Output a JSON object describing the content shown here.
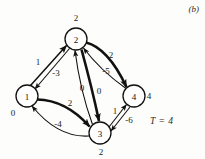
{
  "figure": {
    "panel_label": "(b)",
    "t_label": "T = 4"
  },
  "graph_data": {
    "type": "diagram",
    "nodes": [
      {
        "id": "1",
        "label": "1",
        "dist": "0",
        "cx": 27,
        "cy": 96,
        "r": 11,
        "dist_x": 13,
        "dist_y": 113
      },
      {
        "id": "2",
        "label": "2",
        "dist": "2",
        "cx": 76,
        "cy": 39,
        "r": 11,
        "dist_x": 76,
        "dist_y": 18
      },
      {
        "id": "3",
        "label": "3",
        "dist": "2",
        "cx": 100,
        "cy": 133,
        "r": 11,
        "dist_x": 101,
        "dist_y": 152
      },
      {
        "id": "4",
        "label": "4",
        "dist": "4",
        "cx": 134,
        "cy": 96,
        "r": 11,
        "dist_x": 149,
        "dist_y": 96
      }
    ],
    "edges": [
      {
        "from": "1",
        "to": "2",
        "weight": "1",
        "lx": 38,
        "ly": 62,
        "thick": false,
        "highlight": true
      },
      {
        "from": "2",
        "to": "1",
        "weight": "-3",
        "lx": 56,
        "ly": 73,
        "thick": false,
        "highlight": false
      },
      {
        "from": "2",
        "to": "4",
        "weight": "2",
        "lx": 111,
        "ly": 55,
        "thick": true,
        "highlight": true
      },
      {
        "from": "4",
        "to": "2",
        "weight": "-5",
        "lx": 106,
        "ly": 71,
        "thick": false,
        "highlight": false
      },
      {
        "from": "3",
        "to": "2",
        "weight": "0",
        "lx": 82,
        "ly": 88,
        "thick": false,
        "highlight": false
      },
      {
        "from": "2",
        "to": "3",
        "weight": "0",
        "lx": 99,
        "ly": 91,
        "thick": true,
        "highlight": true
      },
      {
        "from": "1",
        "to": "3",
        "weight": "2",
        "lx": 70,
        "ly": 103,
        "thick": true,
        "highlight": true
      },
      {
        "from": "3",
        "to": "1",
        "weight": "-4",
        "lx": 58,
        "ly": 124,
        "thick": false,
        "highlight": false
      },
      {
        "from": "3",
        "to": "4",
        "weight": "1",
        "lx": 115,
        "ly": 111,
        "thick": false,
        "highlight": false
      },
      {
        "from": "4",
        "to": "3",
        "weight": "-6",
        "lx": 129,
        "ly": 120,
        "thick": false,
        "highlight": false
      }
    ]
  },
  "colors": {
    "stroke": "#111111",
    "node_fill": "#ffffff",
    "background": "#fdfdfb"
  }
}
